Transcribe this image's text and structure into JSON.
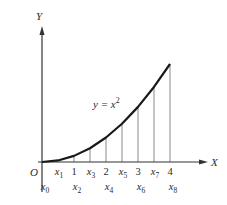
{
  "diagram": {
    "curve_label": "y = x",
    "curve_label_exp": "2",
    "axes": {
      "x_label": "X",
      "y_label": "Y",
      "origin_label": "O"
    },
    "x_ticks_top": [
      {
        "label": "x",
        "sub": "1",
        "x": 0.5
      },
      {
        "label": "1",
        "sub": "",
        "x": 1.0
      },
      {
        "label": "x",
        "sub": "3",
        "x": 1.5
      },
      {
        "label": "2",
        "sub": "",
        "x": 2.0
      },
      {
        "label": "x",
        "sub": "5",
        "x": 2.5
      },
      {
        "label": "3",
        "sub": "",
        "x": 3.0
      },
      {
        "label": "x",
        "sub": "7",
        "x": 3.5
      },
      {
        "label": "4",
        "sub": "",
        "x": 4.0
      }
    ],
    "x_ticks_bottom": [
      {
        "label": "x",
        "sub": "0",
        "x": 0.0
      },
      {
        "label": "x",
        "sub": "2",
        "x": 1.0
      },
      {
        "label": "x",
        "sub": "4",
        "x": 2.0
      },
      {
        "label": "x",
        "sub": "6",
        "x": 3.0
      },
      {
        "label": "x",
        "sub": "8",
        "x": 4.0
      }
    ],
    "partition_points": [
      0,
      0.5,
      1,
      1.5,
      2,
      2.5,
      3,
      3.5,
      4
    ],
    "function": "x^2",
    "colors": {
      "curve": "#1a1a1a",
      "axes": "#333333",
      "verticals": "#888888",
      "text": "#2a2a2a"
    }
  }
}
